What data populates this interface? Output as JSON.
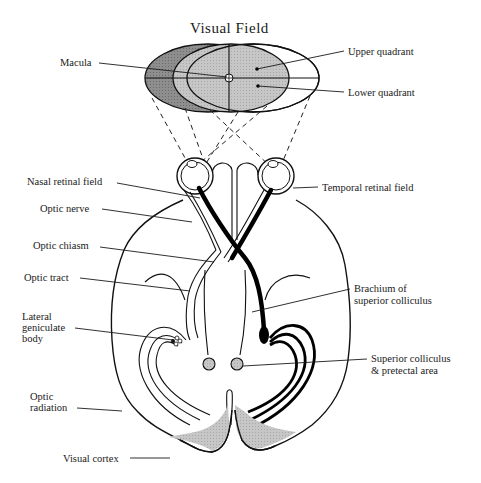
{
  "title": "Visual Field",
  "colors": {
    "left_field_dark": "#8a8a8a",
    "binocular_field": "#c4c4c4",
    "right_field": "#ffffff",
    "cortex_gray": "#cfcfcf",
    "colliculus_gray": "#cccccc",
    "ink": "#111111"
  },
  "labels": {
    "macula": "Macula",
    "upper_quadrant": "Upper quadrant",
    "lower_quadrant": "Lower quadrant",
    "nasal_retinal_field": "Nasal retinal field",
    "temporal_retinal_field": "Temporal retinal field",
    "optic_nerve": "Optic nerve",
    "optic_chiasm": "Optic chiasm",
    "optic_tract": "Optic tract",
    "brachium_line1": "Brachium of",
    "brachium_line2": "superior colliculus",
    "lgb_line1": "Lateral",
    "lgb_line2": "geniculate",
    "lgb_line3": "body",
    "sc_line1": "Superior colliculus",
    "sc_line2": "& pretectal area",
    "optic_radiation_line1": "Optic",
    "optic_radiation_line2": "radiation",
    "visual_cortex": "Visual cortex"
  }
}
